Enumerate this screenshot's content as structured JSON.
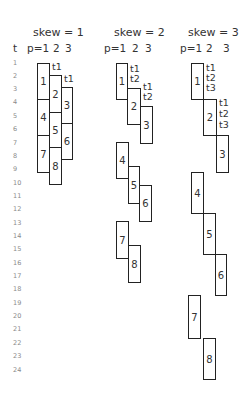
{
  "panels": [
    {
      "title": "skew = 1",
      "skew": 1,
      "columns": [
        "p=1",
        "2",
        "3"
      ],
      "annotations": [
        "t1",
        "t1"
      ],
      "boxes": [
        {
          "label": "1",
          "p": 1,
          "start_t": 1
        },
        {
          "label": "2",
          "p": 2,
          "start_t": 2
        },
        {
          "label": "3",
          "p": 3,
          "start_t": 3
        },
        {
          "label": "4",
          "p": 1,
          "start_t": 4
        },
        {
          "label": "5",
          "p": 2,
          "start_t": 5
        },
        {
          "label": "6",
          "p": 3,
          "start_t": 6
        },
        {
          "label": "7",
          "p": 1,
          "start_t": 7
        },
        {
          "label": "8",
          "p": 2,
          "start_t": 8
        }
      ]
    },
    {
      "title": "skew = 2",
      "skew": 2,
      "columns": [
        "p=1",
        "2",
        "3"
      ],
      "annotations": [
        "t1",
        "t2",
        "t1",
        "t2"
      ],
      "boxes": [
        {
          "label": "1",
          "p": 1,
          "start_t": 1
        },
        {
          "label": "2",
          "p": 2,
          "start_t": 3
        },
        {
          "label": "3",
          "p": 3,
          "start_t": 4
        },
        {
          "label": "4",
          "p": 1,
          "start_t": 7
        },
        {
          "label": "5",
          "p": 2,
          "start_t": 9
        },
        {
          "label": "6",
          "p": 3,
          "start_t": 10
        },
        {
          "label": "7",
          "p": 1,
          "start_t": 13
        },
        {
          "label": "8",
          "p": 2,
          "start_t": 15
        }
      ]
    },
    {
      "title": "skew = 3",
      "skew": 3,
      "columns": [
        "p=1",
        "2",
        "3"
      ],
      "annotations": [
        "t1",
        "t2",
        "t3",
        "t1",
        "t2",
        "t3"
      ],
      "boxes": [
        {
          "label": "1",
          "p": 1,
          "start_t": 1
        },
        {
          "label": "2",
          "p": 2,
          "start_t": 4
        },
        {
          "label": "3",
          "p": 3,
          "start_t": 7
        },
        {
          "label": "4",
          "p": 1,
          "start_t": 10
        },
        {
          "label": "5",
          "p": 2,
          "start_t": 13
        },
        {
          "label": "6",
          "p": 3,
          "start_t": 16
        },
        {
          "label": "7",
          "p": 1,
          "start_t": 19
        },
        {
          "label": "8",
          "p": 2,
          "start_t": 22
        }
      ]
    }
  ],
  "time_axis": {
    "label": "t",
    "ticks": [
      "1",
      "2",
      "3",
      "4",
      "5",
      "6",
      "7",
      "8",
      "9",
      "10",
      "11",
      "12",
      "13",
      "14",
      "15",
      "16",
      "17",
      "18",
      "19",
      "20",
      "21",
      "22",
      "23",
      "24"
    ]
  }
}
